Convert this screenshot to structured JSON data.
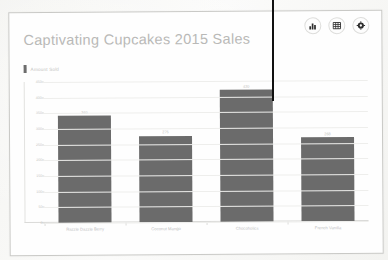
{
  "chart_data": {
    "type": "bar",
    "title": "Captivating Cupcakes 2015 Sales",
    "categories": [
      "Razzle Dazzle Berry",
      "Coconut Mango",
      "Chocoholics",
      "French Vanilla"
    ],
    "values": [
      340,
      275,
      420,
      268
    ],
    "series": [
      {
        "name": "Amount Sold",
        "values": [
          340,
          275,
          420,
          268
        ]
      }
    ],
    "xlabel": "",
    "ylabel": "",
    "ylim": [
      0,
      450
    ],
    "ytick_step": 50,
    "yticks": [
      0,
      50,
      100,
      150,
      200,
      250,
      300,
      350,
      400,
      450
    ],
    "ytick_labels": [
      "0",
      "50",
      "100",
      "150",
      "200",
      "250",
      "300",
      "350",
      "400",
      "450"
    ],
    "grid": true,
    "legend": [
      "Amount Sold"
    ],
    "legend_position": "top-left",
    "bar_color": "#6b6b6b",
    "show_value_labels": true
  },
  "card": {
    "title": "Captivating Cupcakes 2015 Sales",
    "legend_label": "Amount Sold"
  },
  "toolbar": {
    "chart_icon": "bar-chart-icon",
    "table_icon": "table-icon",
    "settings_icon": "gear-icon"
  },
  "colors": {
    "bar": "#6b6b6b",
    "title": "#b9b9b7",
    "grid": "#eeeeec",
    "card_background": "#fefefe"
  }
}
